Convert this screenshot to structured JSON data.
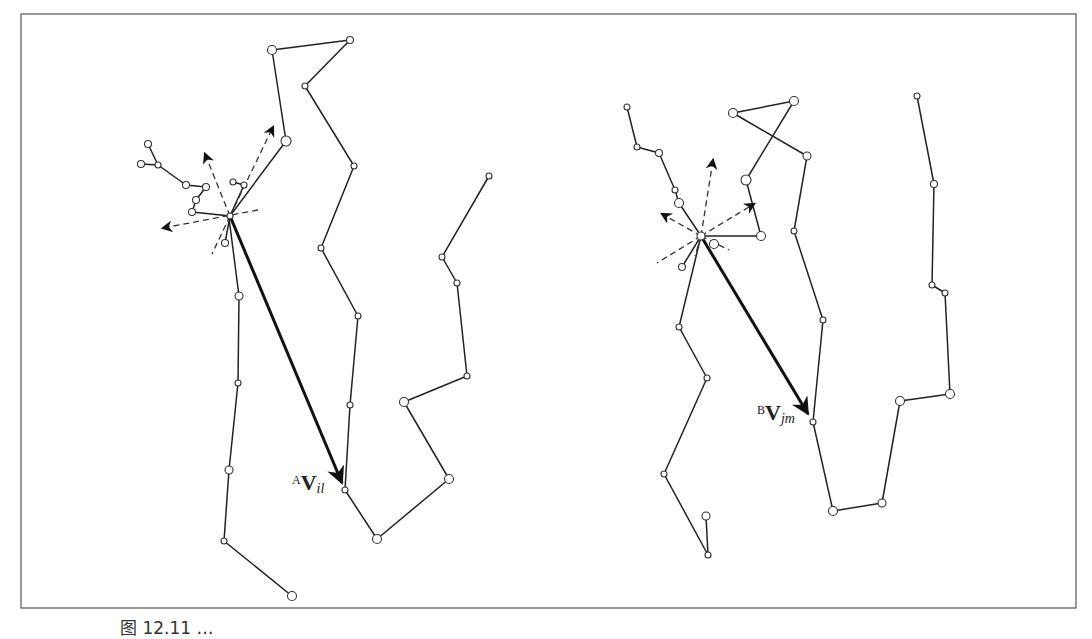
{
  "figure": {
    "caption": "图 12.11 …",
    "left_panel": {
      "vector_label": {
        "superscript": "A",
        "main": "V",
        "subscript": "il"
      }
    },
    "right_panel": {
      "vector_label": {
        "superscript": "B",
        "main": "V",
        "subscript": "jm"
      }
    }
  }
}
